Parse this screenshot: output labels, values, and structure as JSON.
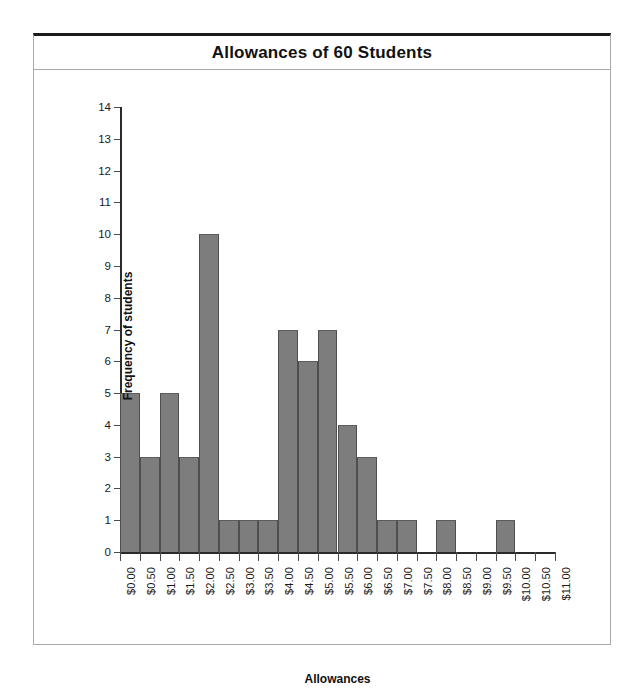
{
  "figure": {
    "title": "Allowances of 60 Students"
  },
  "chart_data": {
    "type": "bar",
    "title": "Allowances of 60 Students",
    "xlabel": "Allowances",
    "ylabel": "Frequency of students",
    "grid": false,
    "legend": "none",
    "bar_color": "#7d7d7d",
    "xlim": [
      0,
      11
    ],
    "ylim": [
      0,
      14
    ],
    "bin_width": 0.5,
    "y_ticks": [
      0,
      1,
      2,
      3,
      4,
      5,
      6,
      7,
      8,
      9,
      10,
      11,
      12,
      13,
      14
    ],
    "y_tick_labels": [
      "0",
      "1",
      "2",
      "3",
      "4",
      "5",
      "6",
      "7",
      "8",
      "9",
      "10",
      "11",
      "12",
      "13",
      "14"
    ],
    "x_ticks": [
      0,
      0.5,
      1,
      1.5,
      2,
      2.5,
      3,
      3.5,
      4,
      4.5,
      5,
      5.5,
      6,
      6.5,
      7,
      7.5,
      8,
      8.5,
      9,
      9.5,
      10,
      10.5,
      11
    ],
    "x_tick_labels": [
      "$0.00",
      "$0.50",
      "$1.00",
      "$1.50",
      "$2.00",
      "$2.50",
      "$3.00",
      "$3.50",
      "$4.00",
      "$4.50",
      "$5.00",
      "$5.50",
      "$6.00",
      "$6.50",
      "$7.00",
      "$7.50",
      "$8.00",
      "$8.50",
      "$9.00",
      "$9.50",
      "$10.00",
      "$10.50",
      "$11.00"
    ],
    "categories": [
      "$0.00-$0.50",
      "$0.50-$1.00",
      "$1.00-$1.50",
      "$1.50-$2.00",
      "$2.00-$2.50",
      "$2.50-$3.00",
      "$3.00-$3.50",
      "$3.50-$4.00",
      "$4.00-$4.50",
      "$4.50-$5.00",
      "$5.00-$5.50",
      "$5.50-$6.00",
      "$6.00-$6.50",
      "$6.50-$7.00",
      "$7.00-$7.50",
      "$7.50-$8.00",
      "$8.00-$8.50",
      "$8.50-$9.00",
      "$9.00-$9.50",
      "$9.50-$10.00",
      "$10.00-$10.50",
      "$10.50-$11.00"
    ],
    "bin_starts": [
      0,
      0.5,
      1,
      1.5,
      2,
      2.5,
      3,
      3.5,
      4,
      4.5,
      5,
      5.5,
      6,
      6.5,
      7,
      7.5,
      8,
      8.5,
      9,
      9.5,
      10,
      10.5
    ],
    "values": [
      5,
      3,
      5,
      3,
      10,
      1,
      1,
      1,
      7,
      6,
      7,
      4,
      3,
      1,
      1,
      0,
      1,
      0,
      0,
      1,
      0,
      0
    ],
    "total": 60
  }
}
